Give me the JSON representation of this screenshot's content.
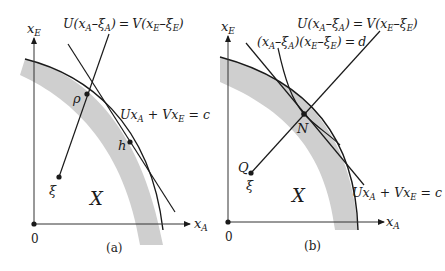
{
  "panels": [
    {
      "id": "a",
      "caption": "(a)",
      "axis_x_label": "x",
      "axis_x_sub": "A",
      "axis_y_label": "x",
      "axis_y_sub": "E",
      "origin_label": "0",
      "region_label": "X",
      "equation_top": "U(x_A − ξ_A) = V(x_E − ξ_E)",
      "equation_line": "Ux_A + Vx_E = c",
      "points": [
        {
          "name": "P",
          "label": "ρ"
        },
        {
          "name": "h",
          "label": "h"
        },
        {
          "name": "xi",
          "label": "ξ"
        }
      ]
    },
    {
      "id": "b",
      "caption": "(b)",
      "axis_x_label": "x",
      "axis_x_sub": "A",
      "axis_y_label": "x",
      "axis_y_sub": "E",
      "origin_label": "0",
      "region_label": "X",
      "equation_top": "U(x_A − ξ_A) = V(x_E − ξ_E)",
      "equation_hyperbola": "(x_A − ξ_A)(x_E − ξ_E) = d",
      "equation_line": "Ux_A + Vx_E = c",
      "points": [
        {
          "name": "N",
          "label": "N"
        },
        {
          "name": "Q",
          "label": "Q"
        },
        {
          "name": "xi",
          "label": "ξ"
        }
      ]
    }
  ],
  "text": {
    "U": "U",
    "V": "V",
    "x": "x",
    "A": "A",
    "E": "E",
    "xi": "ξ",
    "c": "c",
    "d": "d",
    "eq": "=",
    "plus": "+",
    "minus": "–",
    "lp": "(",
    "rp": ")",
    "P": "ρ",
    "h": "h",
    "N": "N",
    "Q": "Q",
    "X": "X",
    "zero": "0",
    "cap_a": "(a)",
    "cap_b": "(b)"
  },
  "colors": {
    "line": "#1a1a1a",
    "band": "#cfcfcf",
    "axis": "#333333"
  }
}
